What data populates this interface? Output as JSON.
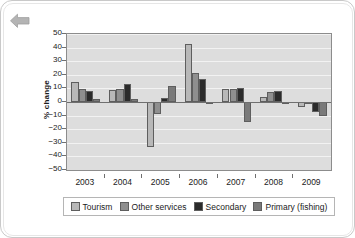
{
  "panel": {
    "back_icon": "back-arrow-icon"
  },
  "chart_data": {
    "type": "bar",
    "title": "",
    "subtitle": "",
    "xlabel": "",
    "ylabel": "% change",
    "categories": [
      "2003",
      "2004",
      "2005",
      "2006",
      "2007",
      "2008",
      "2009"
    ],
    "ylim": [
      -50,
      50
    ],
    "yticks": [
      50,
      40,
      30,
      20,
      10,
      0,
      -10,
      -20,
      -30,
      -40,
      -50
    ],
    "ytick_labels": [
      "50",
      "40",
      "30",
      "20",
      "10",
      "0",
      "−10",
      "−20",
      "−30",
      "−40",
      "−50"
    ],
    "grid": true,
    "legend_position": "bottom",
    "series": [
      {
        "name": "Tourism",
        "color": "#b8b8b8",
        "values": [
          14.5,
          8.5,
          -33,
          42.5,
          9.5,
          3.5,
          -4
        ]
      },
      {
        "name": "Other services",
        "color": "#8f8f8f",
        "values": [
          9.5,
          9.5,
          -9,
          21.5,
          9.5,
          7,
          0
        ]
      },
      {
        "name": "Secondary",
        "color": "#2b2b2b",
        "values": [
          8,
          13,
          3,
          17,
          10,
          8,
          -7
        ]
      },
      {
        "name": "Primary (fishing)",
        "color": "#7a7a7a",
        "values": [
          2,
          2.5,
          11.5,
          -0.5,
          -15,
          -1,
          -10
        ]
      }
    ]
  }
}
